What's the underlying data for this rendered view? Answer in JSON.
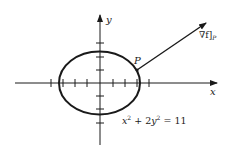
{
  "diagram": {
    "type": "ellipse-with-gradient-vector",
    "axes": {
      "x_label": "x",
      "y_label": "y"
    },
    "point_label": "P",
    "vector_label_main": "∇f",
    "vector_label_sub": "P",
    "vector_label_bracket_open": "[",
    "vector_label_bracket_close": "]",
    "equation": {
      "x_term": "x",
      "x_exp": "2",
      "plus": " + 2",
      "y_term": "y",
      "y_exp": "2",
      "rhs": " = 11"
    },
    "colors": {
      "stroke": "#1a1a1a",
      "background": "#ffffff"
    }
  }
}
